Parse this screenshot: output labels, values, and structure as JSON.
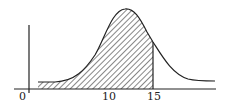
{
  "diagram": {
    "type": "shaded-distribution-curve",
    "axis_labels": {
      "origin": "0",
      "tick_10": "10",
      "tick_15": "15"
    },
    "shaded_region": {
      "from": "start",
      "to": "15",
      "pattern": "diagonal-hatch"
    },
    "colors": {
      "line": "#222222",
      "background": "#ffffff"
    }
  }
}
